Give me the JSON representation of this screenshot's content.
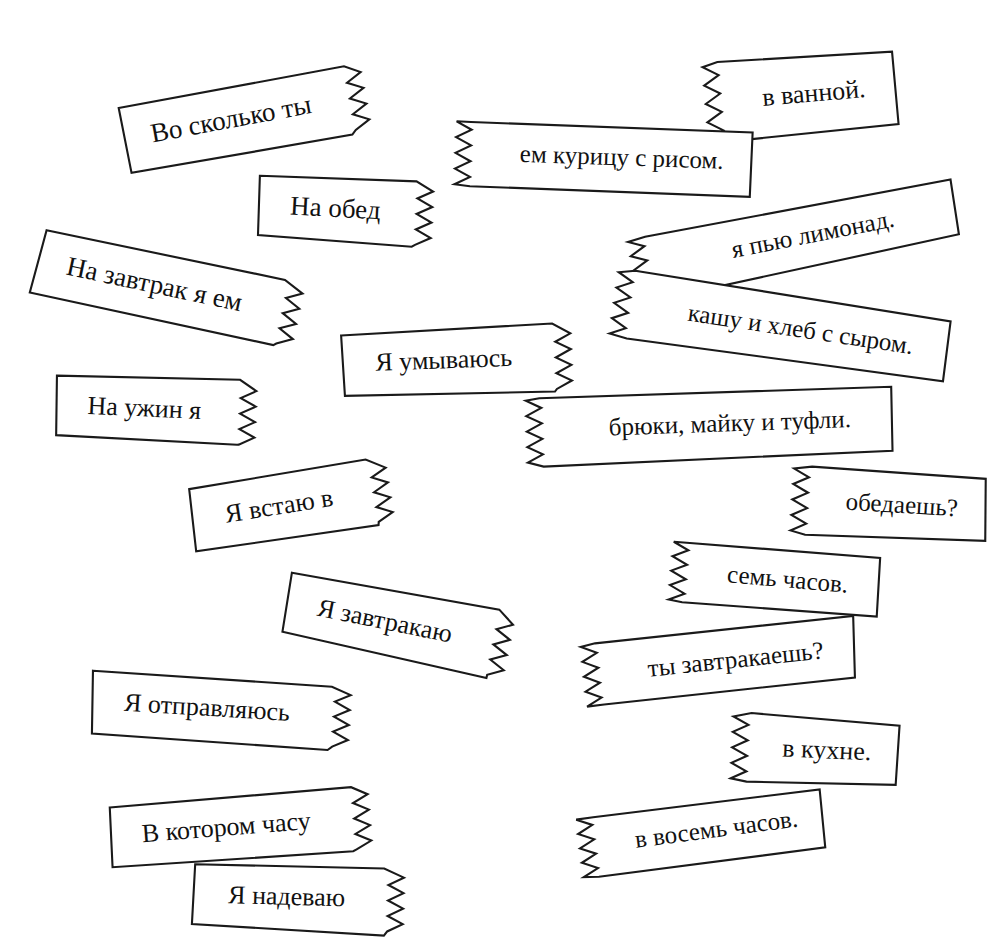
{
  "page": {
    "background_color": "#ffffff",
    "ink_color": "#1a1a1a",
    "paper_color": "#ffffff",
    "width": 1004,
    "height": 938,
    "strip_count": 18,
    "language": "Russian"
  },
  "strips": [
    {
      "id": "vo-skolko-ty",
      "text": "Во сколько ты",
      "torn_side": "right",
      "rotation_deg": -10.5,
      "x": 100,
      "y": 96,
      "w": 236,
      "h": 64,
      "font_size": 27
    },
    {
      "id": "v-vannoy",
      "text": "в ванной.",
      "torn_side": "left",
      "rotation_deg": -5.0,
      "x": 692,
      "y": 52,
      "w": 185,
      "h": 74,
      "font_size": 26
    },
    {
      "id": "em-kuritsu-s-risom",
      "text": "ем курицу с рисом.",
      "torn_side": "left",
      "rotation_deg": 2.0,
      "x": 448,
      "y": 105,
      "w": 290,
      "h": 63,
      "font_size": 25
    },
    {
      "id": "na-obed",
      "text": "На обед",
      "torn_side": "right",
      "rotation_deg": 3.0,
      "x": 247,
      "y": 158,
      "w": 163,
      "h": 62,
      "font_size": 27
    },
    {
      "id": "ya-pyu-limonad",
      "text": "я пью лимонад.",
      "torn_side": "left",
      "rotation_deg": -11.0,
      "x": 616,
      "y": 228,
      "w": 320,
      "h": 58,
      "font_size": 25
    },
    {
      "id": "na-zavtrak-ya-em",
      "text": "На завтрак я ем",
      "torn_side": "right",
      "rotation_deg": 12.0,
      "x": 33,
      "y": 212,
      "w": 256,
      "h": 62,
      "font_size": 27
    },
    {
      "id": "kashu-i-khleb",
      "text": "кашу и хлеб с сыром.",
      "torn_side": "left",
      "rotation_deg": 8.5,
      "x": 612,
      "y": 255,
      "w": 330,
      "h": 62,
      "font_size": 25
    },
    {
      "id": "ya-umyvayus",
      "text": "Я умываюсь",
      "torn_side": "right",
      "rotation_deg": -2.0,
      "x": 325,
      "y": 318,
      "w": 220,
      "h": 63,
      "font_size": 26
    },
    {
      "id": "na-uzhin-ya",
      "text": "На ужин я",
      "torn_side": "right",
      "rotation_deg": 2.5,
      "x": 43,
      "y": 358,
      "w": 190,
      "h": 62,
      "font_size": 26
    },
    {
      "id": "bryuki-mayku-tufli",
      "text": "брюки, майку и туфли.",
      "torn_side": "left",
      "rotation_deg": -2.0,
      "x": 516,
      "y": 385,
      "w": 357,
      "h": 62,
      "font_size": 25
    },
    {
      "id": "obedaesh",
      "text": "обедаешь?",
      "torn_side": "left",
      "rotation_deg": 3.5,
      "x": 786,
      "y": 452,
      "w": 187,
      "h": 62,
      "font_size": 25
    },
    {
      "id": "ya-vstayu-v",
      "text": "Я встаю в",
      "torn_side": "right",
      "rotation_deg": -9.0,
      "x": 170,
      "y": 478,
      "w": 190,
      "h": 60,
      "font_size": 26
    },
    {
      "id": "sem-chasov",
      "text": "семь часов.",
      "torn_side": "left",
      "rotation_deg": 5.0,
      "x": 666,
      "y": 525,
      "w": 200,
      "h": 58,
      "font_size": 25
    },
    {
      "id": "ya-zavtrakayu",
      "text": "Я завтракаю",
      "torn_side": "right",
      "rotation_deg": 11.5,
      "x": 280,
      "y": 553,
      "w": 218,
      "h": 62,
      "font_size": 26
    },
    {
      "id": "ty-zavtrakaesh",
      "text": "ты завтракаешь?",
      "torn_side": "left",
      "rotation_deg": -6.0,
      "x": 570,
      "y": 632,
      "w": 265,
      "h": 60,
      "font_size": 25
    },
    {
      "id": "ya-otpravlyayus",
      "text": "Я отправляюсь",
      "torn_side": "right",
      "rotation_deg": 3.5,
      "x": 80,
      "y": 655,
      "w": 248,
      "h": 60,
      "font_size": 26
    },
    {
      "id": "v-kukhne",
      "text": "в кухне.",
      "torn_side": "left",
      "rotation_deg": 2.5,
      "x": 725,
      "y": 700,
      "w": 160,
      "h": 62,
      "font_size": 26
    },
    {
      "id": "v-vosem-chasov",
      "text": "в восемь часов.",
      "torn_side": "left",
      "rotation_deg": -7.5,
      "x": 565,
      "y": 805,
      "w": 238,
      "h": 58,
      "font_size": 25
    },
    {
      "id": "v-kotorom-chasu",
      "text": "В котором часу",
      "torn_side": "right",
      "rotation_deg": -4.5,
      "x": 92,
      "y": 792,
      "w": 250,
      "h": 62,
      "font_size": 26
    },
    {
      "id": "ya-nadevayu",
      "text": "Я надеваю",
      "torn_side": "right",
      "rotation_deg": 1.5,
      "x": 180,
      "y": 848,
      "w": 200,
      "h": 62,
      "font_size": 26
    }
  ]
}
